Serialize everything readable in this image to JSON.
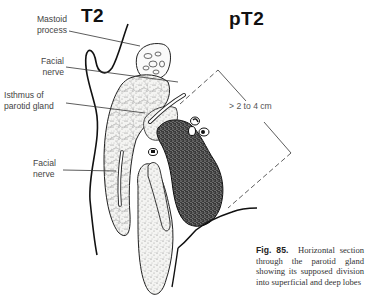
{
  "figure": {
    "panel_left_title": "T2",
    "panel_right_title": "pT2",
    "labels": {
      "mastoid_line1": "Mastoid",
      "mastoid_line2": "process",
      "facial_upper_line1": "Facial",
      "facial_upper_line2": "nerve",
      "isthmus_line1": "Isthmus of",
      "isthmus_line2": "parotid gland",
      "facial_lower_line1": "Facial",
      "facial_lower_line2": "nerve"
    },
    "measurement": "> 2 to 4 cm",
    "caption": {
      "number": "Fig. 85.",
      "text": "Horizontal section through the parotid gland showing its supposed division into superficial and deep lobes"
    }
  }
}
